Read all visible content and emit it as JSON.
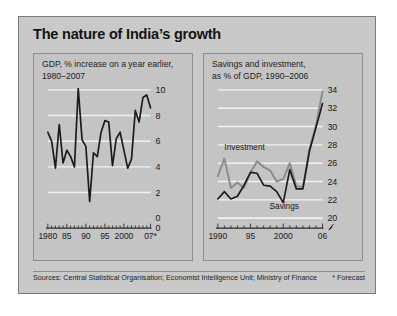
{
  "title": "The nature of India’s growth",
  "footer": {
    "sources": "Sources: Central Statistical Organisation; Economist Intelligence Unit; Ministry of Finance",
    "forecast_note": "* Forecast"
  },
  "colors": {
    "figure_background": "#c9c9c9",
    "panel_background": "#c4c4c4",
    "panel_border": "#8e8e8e",
    "gridline": "#f2f2f2",
    "series_dark": "#1b1b1b",
    "series_gray": "#8c8c8c",
    "text": "#1a1a1a"
  },
  "panels": {
    "left": {
      "title_line1": "GDP, % increase on a year earlier,",
      "title_line2": "1980–2007"
    },
    "right": {
      "title_line1": "Savings and investment,",
      "title_line2": "as % of GDP, 1990–2006"
    }
  },
  "chart_data": [
    {
      "type": "line",
      "id": "gdp-growth",
      "title": "GDP, % increase on a year earlier, 1980–2007",
      "xlabel": "",
      "ylabel": "",
      "ylim": [
        0,
        10
      ],
      "yticks": [
        0,
        2,
        4,
        6,
        8,
        10
      ],
      "ytick_labels": [
        "0",
        "2",
        "4",
        "6",
        "8",
        "10"
      ],
      "xlim": [
        1980,
        2007
      ],
      "xticks": [
        1980,
        1985,
        1990,
        1995,
        2000,
        2007
      ],
      "xtick_labels": [
        "1980",
        "85",
        "90",
        "95",
        "2000",
        "07*"
      ],
      "grid": true,
      "legend": "none",
      "minor_ticks_every": 1,
      "series": [
        {
          "name": "GDP growth",
          "color": "#1b1b1b",
          "x": [
            1980,
            1981,
            1982,
            1983,
            1984,
            1985,
            1986,
            1987,
            1988,
            1989,
            1990,
            1991,
            1992,
            1993,
            1994,
            1995,
            1996,
            1997,
            1998,
            1999,
            2000,
            2001,
            2002,
            2003,
            2004,
            2005,
            2006,
            2007
          ],
          "values": [
            6.7,
            6.0,
            3.9,
            7.3,
            4.3,
            5.3,
            4.8,
            4.0,
            10.1,
            6.1,
            5.6,
            1.3,
            5.1,
            4.8,
            6.7,
            7.6,
            7.5,
            4.1,
            6.2,
            6.7,
            5.3,
            3.9,
            4.6,
            8.4,
            7.5,
            9.4,
            9.6,
            8.6
          ]
        }
      ]
    },
    {
      "type": "line",
      "id": "savings-investment",
      "title": "Savings and investment, as % of GDP, 1990–2006",
      "xlabel": "",
      "ylabel": "",
      "ylim": [
        20,
        34
      ],
      "yticks": [
        20,
        22,
        24,
        26,
        28,
        30,
        32,
        34
      ],
      "ytick_labels": [
        "20",
        "22",
        "24",
        "26",
        "28",
        "30",
        "32",
        "34"
      ],
      "axis_break": true,
      "xlim": [
        1990,
        2006
      ],
      "xticks": [
        1990,
        1995,
        2000,
        2006
      ],
      "xtick_labels": [
        "1990",
        "95",
        "2000",
        "06"
      ],
      "grid": true,
      "legend": "inline-labels",
      "minor_ticks_every": 1,
      "annotations": [
        {
          "text": "Investment",
          "x": 1991.0,
          "y": 27.4
        },
        {
          "text": "Savings",
          "x": 1997.9,
          "y": 21.0
        }
      ],
      "series": [
        {
          "name": "Investment",
          "color": "#8c8c8c",
          "x": [
            1990,
            1991,
            1992,
            1993,
            1994,
            1995,
            1996,
            1997,
            1998,
            1999,
            2000,
            2001,
            2002,
            2003,
            2004,
            2005,
            2006
          ],
          "values": [
            24.6,
            26.5,
            23.3,
            23.9,
            23.3,
            25.0,
            26.2,
            25.6,
            25.2,
            24.0,
            24.3,
            26.0,
            23.5,
            23.4,
            27.5,
            30.1,
            33.8
          ]
        },
        {
          "name": "Savings",
          "color": "#1b1b1b",
          "x": [
            1990,
            1991,
            1992,
            1993,
            1994,
            1995,
            1996,
            1997,
            1998,
            1999,
            2000,
            2001,
            2002,
            2003,
            2004,
            2005,
            2006
          ],
          "values": [
            22.1,
            22.9,
            22.1,
            22.4,
            23.6,
            25.0,
            24.9,
            23.6,
            23.5,
            22.9,
            21.7,
            25.3,
            23.2,
            23.2,
            27.3,
            29.9,
            32.5
          ]
        }
      ]
    }
  ]
}
